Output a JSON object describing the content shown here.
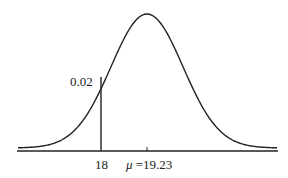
{
  "chart_data": {
    "type": "line",
    "title": "",
    "distribution": "normal",
    "mean": 19.23,
    "marked_x": 18,
    "marked_density": 0.02,
    "xlabel": "",
    "ylabel": "",
    "grid": false,
    "annotations": [
      "0.02",
      "18",
      "μ =19.23"
    ]
  },
  "labels": {
    "density": "0.02",
    "x_mark": "18",
    "mu_symbol": "μ",
    "mu_value": " =19.23"
  },
  "colors": {
    "stroke": "#222222",
    "background": "#ffffff"
  }
}
